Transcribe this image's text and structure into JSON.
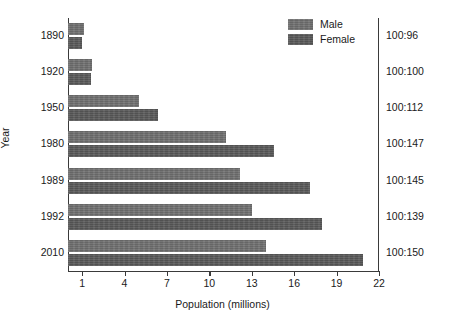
{
  "chart_data": {
    "type": "bar",
    "orientation": "horizontal",
    "title": "",
    "xlabel": "Population (millions)",
    "ylabel": "Year",
    "y2label": "Male:female ratio",
    "categories": [
      "1890",
      "1920",
      "1950",
      "1980",
      "1989",
      "1992",
      "2010"
    ],
    "series": [
      {
        "name": "Male",
        "color": "#6f6f6f",
        "values": [
          1.1,
          1.7,
          5.0,
          11.2,
          12.2,
          13.0,
          14.0
        ]
      },
      {
        "name": "Female",
        "color": "#585858",
        "values": [
          1.0,
          1.6,
          6.4,
          14.6,
          17.1,
          18.0,
          20.9
        ]
      }
    ],
    "secondary_axis_labels": [
      "100:96",
      "100:100",
      "100:112",
      "100:147",
      "100:145",
      "100:139",
      "100:150"
    ],
    "xlim": [
      0,
      22
    ],
    "xticks": [
      1,
      4,
      7,
      10,
      13,
      16,
      19,
      22
    ],
    "xticklabels": [
      "1",
      "4",
      "7",
      "10",
      "13",
      "16",
      "19",
      "22"
    ],
    "grid": false,
    "legend_position": "top-right",
    "legend": [
      "Male",
      "Female"
    ]
  }
}
